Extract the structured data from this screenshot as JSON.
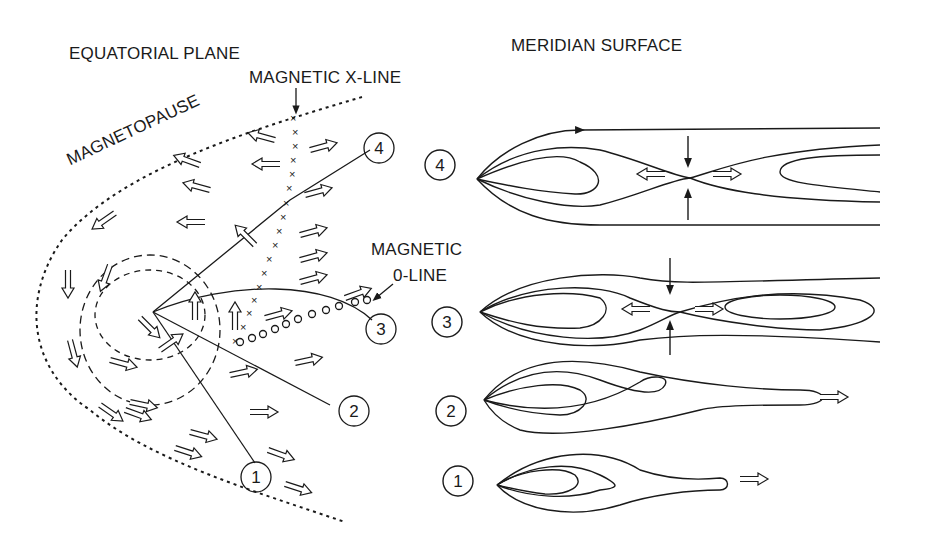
{
  "left_panel": {
    "title": "EQUATORIAL PLANE",
    "labels": {
      "magnetopause": "MAGNETOPAUSE",
      "x_line": "MAGNETIC X-LINE",
      "o_line_1": "MAGNETIC",
      "o_line_2": "0-LINE"
    },
    "markers": [
      "1",
      "2",
      "3",
      "4"
    ]
  },
  "right_panel": {
    "title": "MERIDIAN SURFACE",
    "stages": [
      "4",
      "3",
      "2",
      "1"
    ]
  },
  "colors": {
    "ink": "#1a1a1a",
    "background": "#ffffff"
  }
}
